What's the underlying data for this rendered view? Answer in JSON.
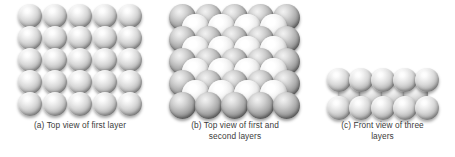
{
  "figure": {
    "background_color": "#ffffff",
    "caption_color": "#3b3b3b",
    "sphere_colors": {
      "highlight": "#ffffff",
      "midtone": "#bdbdbd",
      "shadow": "#6a6a6a",
      "first_layer_shadow": "#585858",
      "second_layer_highlight": "#ffffff"
    }
  },
  "panels": [
    {
      "id": "a",
      "label": "a",
      "caption": "(a) Top view of first layer",
      "view": "top",
      "layers_shown": 1,
      "arrangement": "square-grid",
      "grid": {
        "rows": 5,
        "cols": 5
      },
      "sphere_count": 25,
      "sphere_diameter_px": 24,
      "spacing_x_px": 25,
      "spacing_y_px": 22
    },
    {
      "id": "b",
      "label": "b",
      "caption": "(b) Top view of first and\nsecond layers",
      "view": "top",
      "layers_shown": 2,
      "arrangement": "square-grid-with-offset-second-layer",
      "first_layer": {
        "rows": 5,
        "cols": 5,
        "sphere_count": 25
      },
      "second_layer": {
        "rows": 4,
        "cols": 4,
        "sphere_count": 16,
        "offset_fraction": 0.5
      },
      "sphere_count": 41,
      "sphere_diameter_px": 27,
      "spacing_x_px": 26,
      "spacing_y_px": 22
    },
    {
      "id": "c",
      "label": "c",
      "caption": "(c) Front view of three\nlayers",
      "view": "front",
      "layers_shown": 3,
      "arrangement": "stacked-offset-rows",
      "rows": [
        {
          "name": "top-layer",
          "sphere_count": 5,
          "offset_fraction": 0
        },
        {
          "name": "middle-layer",
          "sphere_count": 4,
          "offset_fraction": 0.5
        },
        {
          "name": "bottom-layer",
          "sphere_count": 5,
          "offset_fraction": 0
        }
      ],
      "sphere_count": 14,
      "sphere_diameter_px": 24,
      "spacing_x_px": 22,
      "row_pitch_px": 14
    }
  ]
}
